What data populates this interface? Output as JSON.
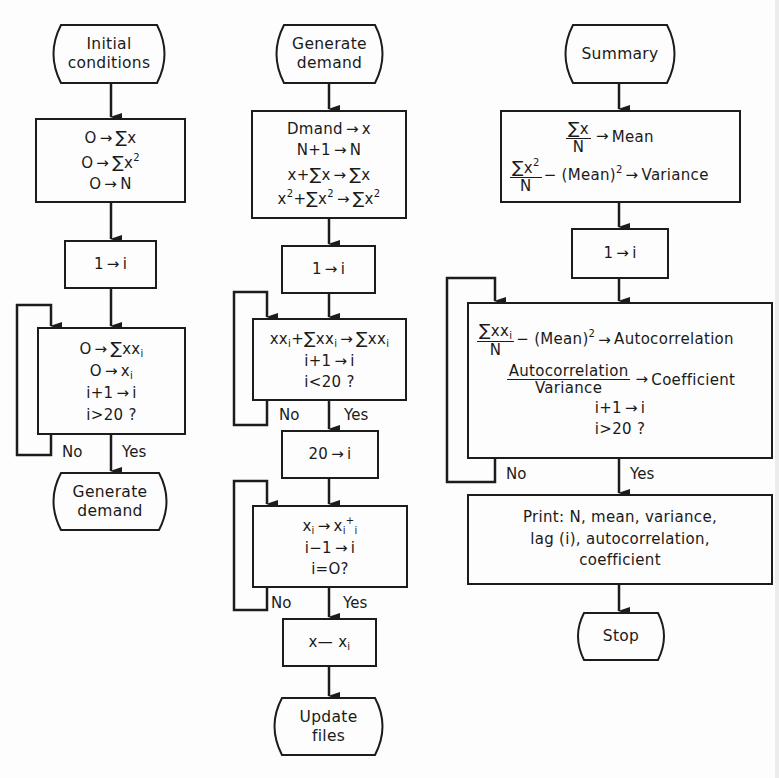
{
  "diagram": {
    "type": "flowchart",
    "columns": [
      {
        "id": "initialization",
        "nodes": [
          {
            "id": "t_initial",
            "shape": "terminal",
            "lines": [
              "Initial",
              "conditions"
            ]
          },
          {
            "id": "b_zero",
            "shape": "process",
            "lines": [
              "O → Σx",
              "O → Σx²",
              "O → N"
            ]
          },
          {
            "id": "b_i1",
            "shape": "process",
            "lines": [
              "1 → i"
            ]
          },
          {
            "id": "b_loop1",
            "shape": "process-decision",
            "lines": [
              "O → Σxxᵢ",
              "O → xᵢ",
              "i+1 → i",
              "i>20 ?"
            ],
            "no": "loop back",
            "yes": "t_gen"
          },
          {
            "id": "t_gen",
            "shape": "terminal",
            "lines": [
              "Generate",
              "demand"
            ]
          }
        ]
      },
      {
        "id": "generate",
        "nodes": [
          {
            "id": "t_gen2",
            "shape": "terminal",
            "lines": [
              "Generate",
              "demand"
            ]
          },
          {
            "id": "b_demand",
            "shape": "process",
            "lines": [
              "Dmand → x",
              "N+1 → N",
              "x+Σx → Σx",
              "x²+Σx² → Σx²"
            ]
          },
          {
            "id": "b_i1b",
            "shape": "process",
            "lines": [
              "1 → i"
            ]
          },
          {
            "id": "b_loop2",
            "shape": "process-decision",
            "lines": [
              "xxᵢ+Σxxᵢ → Σxxᵢ",
              "i+1 → i",
              "i<20 ?"
            ],
            "no": "loop back",
            "yes": "b_i20"
          },
          {
            "id": "b_i20",
            "shape": "process",
            "lines": [
              "20 → i"
            ]
          },
          {
            "id": "b_loop3",
            "shape": "process-decision",
            "lines": [
              "xᵢ → xᵢ₊ᵢ",
              "i−1 → i",
              "i=O?"
            ],
            "no": "loop back",
            "yes": "b_xxi"
          },
          {
            "id": "b_xxi",
            "shape": "process",
            "lines": [
              "x— xᵢ"
            ]
          },
          {
            "id": "t_update",
            "shape": "terminal",
            "lines": [
              "Update",
              "files"
            ]
          }
        ]
      },
      {
        "id": "summary",
        "nodes": [
          {
            "id": "t_summary",
            "shape": "terminal",
            "lines": [
              "Summary"
            ]
          },
          {
            "id": "b_stats",
            "shape": "process",
            "lines": [
              "Σx/N → Mean",
              "Σx²/N − (Mean)² → Variance"
            ]
          },
          {
            "id": "b_i1c",
            "shape": "process",
            "lines": [
              "1 → i"
            ]
          },
          {
            "id": "b_loop4",
            "shape": "process-decision",
            "lines": [
              "Σxxᵢ/N − (Mean)² → Autocorrelation",
              "Autocorrelation/Variance → Coefficient",
              "i+1 → i",
              "i>20 ?"
            ],
            "no": "loop back",
            "yes": "b_print"
          },
          {
            "id": "b_print",
            "shape": "process",
            "lines": [
              "Print: N, mean, variance,",
              "lag (i), autocorrelation,",
              "coefficient"
            ]
          },
          {
            "id": "t_stop",
            "shape": "terminal",
            "lines": [
              "Stop"
            ]
          }
        ]
      }
    ]
  },
  "text": {
    "arrow": "→",
    "sigma": "∑",
    "no": "No",
    "yes": "Yes",
    "zero": "O",
    "one": "1",
    "i": "i",
    "x": "x",
    "xx": "xx",
    "sq": "2",
    "N": "N",
    "plus": "+",
    "twenty": "20",
    "col1": {
      "start_l1": "Initial",
      "start_l2": "conditions",
      "q": "i>20 ?",
      "inc": "i+1",
      "end_l1": "Generate",
      "end_l2": "demand"
    },
    "col2": {
      "start_l1": "Generate",
      "start_l2": "demand",
      "dmand": "Dmand",
      "n_plus": "N+1",
      "x_plus": "x+",
      "inc": "i+1",
      "q1": "i<20 ?",
      "dec": "i−1",
      "q2": "i=O?",
      "xdash": "x—",
      "end_l1": "Update",
      "end_l2": "files"
    },
    "col3": {
      "start": "Summary",
      "mean": "Mean",
      "minus_mean_sq": "− (Mean)",
      "variance": "Variance",
      "autocorr": "Autocorrelation",
      "coefficient": "Coefficient",
      "inc": "i+1",
      "q": "i>20 ?",
      "print_l1": "Print: N, mean, variance,",
      "print_l2": "lag (i), autocorrelation,",
      "print_l3": "coefficient",
      "stop": "Stop"
    }
  },
  "colors": {
    "ink": "#1c1c1c",
    "paper": "#fdfdfd"
  }
}
